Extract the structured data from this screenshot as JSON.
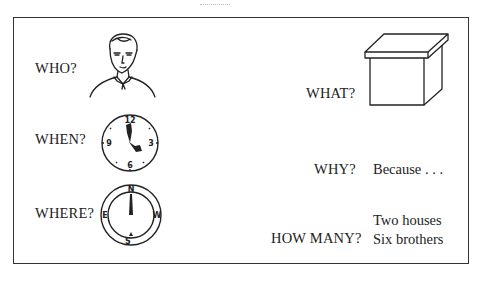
{
  "questions": {
    "who": {
      "label": "WHO?",
      "illustration": "man-portrait-icon"
    },
    "when": {
      "label": "WHEN?",
      "illustration": "clock-icon",
      "clock_numbers": [
        "12",
        "3",
        "6",
        "9"
      ]
    },
    "where": {
      "label": "WHERE?",
      "illustration": "compass-icon",
      "compass_points": [
        "N",
        "E",
        "S",
        "W"
      ]
    },
    "what": {
      "label": "WHAT?",
      "illustration": "box-icon"
    },
    "why": {
      "label": "WHY?",
      "answer": "Because . . ."
    },
    "how_many": {
      "label": "HOW MANY?",
      "answers": [
        "Two houses",
        "Six brothers"
      ]
    }
  }
}
